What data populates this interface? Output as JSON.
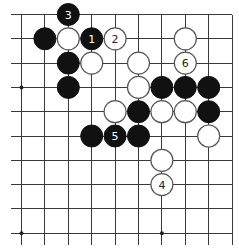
{
  "diagram": {
    "type": "go-board-fragment",
    "region": "top-right corner",
    "columns": 10,
    "rows": 10,
    "edges": {
      "top": true,
      "right": true,
      "left": false,
      "bottom": false
    },
    "star_points": [
      {
        "col": 0,
        "row": 3
      },
      {
        "col": 6,
        "row": 3
      },
      {
        "col": 0,
        "row": 9
      },
      {
        "col": 6,
        "row": 9
      }
    ],
    "colors": {
      "black_stone": "#111111",
      "white_stone": "#ffffff",
      "grid": "#3a3a3a"
    },
    "stones": [
      {
        "color": "black",
        "col": 2,
        "row": 0,
        "label": "3"
      },
      {
        "color": "black",
        "col": 1,
        "row": 1,
        "label": ""
      },
      {
        "color": "white",
        "col": 2,
        "row": 1,
        "label": ""
      },
      {
        "color": "black",
        "col": 3,
        "row": 1,
        "label": "1"
      },
      {
        "color": "white",
        "col": 4,
        "row": 1,
        "label": "2"
      },
      {
        "color": "white",
        "col": 7,
        "row": 1,
        "label": ""
      },
      {
        "color": "black",
        "col": 2,
        "row": 2,
        "label": ""
      },
      {
        "color": "white",
        "col": 3,
        "row": 2,
        "label": ""
      },
      {
        "color": "white",
        "col": 5,
        "row": 2,
        "label": ""
      },
      {
        "color": "white",
        "col": 7,
        "row": 2,
        "label": "6"
      },
      {
        "color": "black",
        "col": 2,
        "row": 3,
        "label": ""
      },
      {
        "color": "white",
        "col": 5,
        "row": 3,
        "label": ""
      },
      {
        "color": "black",
        "col": 6,
        "row": 3,
        "label": ""
      },
      {
        "color": "black",
        "col": 7,
        "row": 3,
        "label": ""
      },
      {
        "color": "black",
        "col": 8,
        "row": 3,
        "label": ""
      },
      {
        "color": "white",
        "col": 4,
        "row": 4,
        "label": ""
      },
      {
        "color": "black",
        "col": 5,
        "row": 4,
        "label": ""
      },
      {
        "color": "white",
        "col": 6,
        "row": 4,
        "label": ""
      },
      {
        "color": "white",
        "col": 7,
        "row": 4,
        "label": ""
      },
      {
        "color": "black",
        "col": 8,
        "row": 4,
        "label": ""
      },
      {
        "color": "black",
        "col": 3,
        "row": 5,
        "label": ""
      },
      {
        "color": "black",
        "col": 4,
        "row": 5,
        "label": "5"
      },
      {
        "color": "black",
        "col": 5,
        "row": 5,
        "label": ""
      },
      {
        "color": "white",
        "col": 8,
        "row": 5,
        "label": ""
      },
      {
        "color": "white",
        "col": 6,
        "row": 6,
        "label": ""
      },
      {
        "color": "white",
        "col": 6,
        "row": 7,
        "label": "4"
      }
    ]
  }
}
